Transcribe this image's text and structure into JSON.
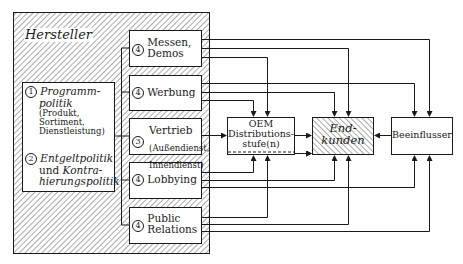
{
  "diagram": {
    "manufacturer": {
      "title": "Hersteller",
      "policies": [
        {
          "number": "1",
          "title_line1": "Programm-",
          "title_line2": "politik",
          "sub1": "(Produkt,",
          "sub2": "Sortiment,",
          "sub3": "Dienstleistung)"
        },
        {
          "number": "2",
          "title_line1": "Entgeltpolitik",
          "title_line2_plain": "und",
          "title_line2_ital": "Kontra-",
          "title_line3": "hierungspolitik"
        }
      ],
      "instruments": [
        {
          "id": "messen",
          "number": "4",
          "line1": "Messen,",
          "line2": "Demos"
        },
        {
          "id": "werbung",
          "number": "4",
          "line1": "Werbung",
          "line2": ""
        },
        {
          "id": "vertrieb",
          "number": "3",
          "line1": "Vertrieb",
          "line2": "(Außendienst,",
          "line3": "Innendienst)"
        },
        {
          "id": "lobbying",
          "number": "4",
          "line1": "Lobbying",
          "line2": ""
        },
        {
          "id": "pr",
          "number": "4",
          "line1": "Public",
          "line2": "Relations"
        }
      ]
    },
    "targets": {
      "oem": {
        "line1": "OEM",
        "line2": "Distributions-",
        "line3": "stufe(n)"
      },
      "endkunden": {
        "line1": "End-",
        "line2": "kunden"
      },
      "beeinflusser": {
        "label": "Beeinflusser"
      }
    },
    "colors": {
      "line": "#1a1a1a",
      "hatch": "#555555",
      "background": "#ffffff"
    }
  }
}
